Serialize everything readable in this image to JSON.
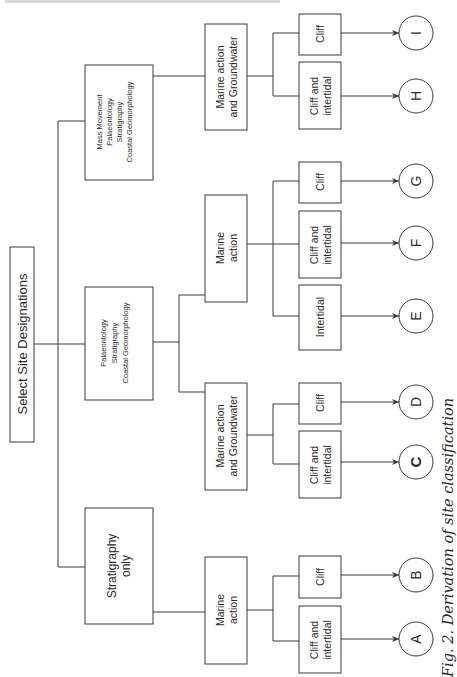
{
  "diagram": {
    "caption": "Fig. 2. Derivation of site classification",
    "root": {
      "label": "Select Site Designations"
    },
    "level1": [
      {
        "id": "mass",
        "lines": [
          "Mass Movement",
          "Palaeontology",
          "Stratigraphy",
          "Coastal Geomorphology"
        ]
      },
      {
        "id": "palaeo",
        "lines": [
          "Palaeontology",
          "Stratigraphy",
          "Coastal Geomorphology"
        ]
      },
      {
        "id": "strat",
        "lines": [
          "Stratigraphy",
          "only"
        ]
      }
    ],
    "level2": [
      {
        "id": "mass-mag",
        "parent": "mass",
        "lines": [
          "Marine action",
          "and Groundwater"
        ]
      },
      {
        "id": "palaeo-ma",
        "parent": "palaeo",
        "lines": [
          "Marine",
          "action"
        ]
      },
      {
        "id": "palaeo-mag",
        "parent": "palaeo",
        "lines": [
          "Marine action",
          "and Groundwater"
        ]
      },
      {
        "id": "strat-ma",
        "parent": "strat",
        "lines": [
          "Marine",
          "action"
        ]
      }
    ],
    "level3": [
      {
        "id": "l-i",
        "parent": "mass-mag",
        "lines": [
          "Cliff"
        ],
        "outcome": "I"
      },
      {
        "id": "l-h",
        "parent": "mass-mag",
        "lines": [
          "Cliff and",
          "intertidal"
        ],
        "outcome": "H"
      },
      {
        "id": "l-g",
        "parent": "palaeo-ma",
        "lines": [
          "Cliff"
        ],
        "outcome": "G"
      },
      {
        "id": "l-f",
        "parent": "palaeo-ma",
        "lines": [
          "Cliff and",
          "intertidal"
        ],
        "outcome": "F"
      },
      {
        "id": "l-e",
        "parent": "palaeo-ma",
        "lines": [
          "Intertidal"
        ],
        "outcome": "E"
      },
      {
        "id": "l-d",
        "parent": "palaeo-mag",
        "lines": [
          "Cliff"
        ],
        "outcome": "D"
      },
      {
        "id": "l-c",
        "parent": "palaeo-mag",
        "lines": [
          "Cliff and",
          "intertidal"
        ],
        "outcome": "C"
      },
      {
        "id": "l-b",
        "parent": "strat-ma",
        "lines": [
          "Cliff"
        ],
        "outcome": "B"
      },
      {
        "id": "l-a",
        "parent": "strat-ma",
        "lines": [
          "Cliff and",
          "intertidal"
        ],
        "outcome": "A"
      }
    ],
    "outcomes": [
      "I",
      "H",
      "G",
      "F",
      "E",
      "D",
      "C",
      "B",
      "A"
    ]
  }
}
